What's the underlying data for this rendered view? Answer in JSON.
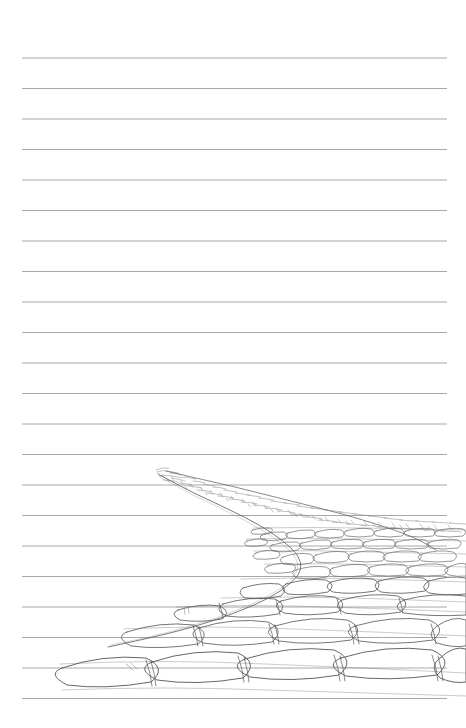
{
  "page": {
    "width": 466,
    "height": 728,
    "background_color": "#ffffff",
    "paper_type": "ruled-notebook"
  },
  "ruling": {
    "name": "horizontal-ruled-lines",
    "line_color": "#a8a8a8",
    "line_width": 1,
    "count": 22,
    "first_line_y": 58,
    "spacing": 30.5,
    "x_start": 22,
    "x_end": 447,
    "line_y_values": [
      58,
      88.5,
      119,
      149.5,
      180,
      210.5,
      241,
      271.5,
      302,
      332.5,
      363,
      393.5,
      424,
      454.5,
      485,
      515.5,
      546,
      576.5,
      607,
      637.5,
      668,
      698.5
    ]
  },
  "drawing": {
    "name": "cobblestone-path-sketch",
    "subject": "Cobblestone path receding in perspective",
    "medium": "pencil line drawing",
    "ink_color": "#5d5d63",
    "haze_color": "#8b8b93",
    "vanishing_point": {
      "x": 158,
      "y": 473
    },
    "bounds": {
      "x": 60,
      "y": 466,
      "width": 406,
      "height": 230
    },
    "description": "A hand-drawn stone-paved path curving from a distant point at upper left, widening and descending diagonally to fill the lower right of the page. Individual stones grow from tiny scribbles at the horizon to large rounded quadrilateral blocks in the foreground.",
    "path_left_edge": [
      [
        158,
        474
      ],
      [
        190,
        492
      ],
      [
        240,
        512
      ],
      [
        300,
        545
      ],
      [
        330,
        575
      ],
      [
        300,
        600
      ],
      [
        225,
        632
      ],
      [
        120,
        660
      ],
      [
        62,
        676
      ]
    ],
    "path_right_edge": [
      [
        166,
        471
      ],
      [
        235,
        487
      ],
      [
        320,
        509
      ],
      [
        400,
        528
      ],
      [
        452,
        545
      ],
      [
        466,
        560
      ]
    ],
    "zones": [
      {
        "name": "distant-scribble-zone",
        "y_range": [
          466,
          520
        ],
        "stone_scale": "tiny",
        "detail": "dense textural scribbles"
      },
      {
        "name": "mid-ground-zone",
        "y_range": [
          520,
          585
        ],
        "stone_scale": "small",
        "detail": "small cobbles in staggered courses"
      },
      {
        "name": "near-ground-zone",
        "y_range": [
          585,
          640
        ],
        "stone_scale": "medium",
        "detail": "rounded rectangular pavers"
      },
      {
        "name": "foreground-zone",
        "y_range": [
          640,
          696
        ],
        "stone_scale": "large",
        "detail": "large flagstones crossing page width"
      }
    ]
  }
}
